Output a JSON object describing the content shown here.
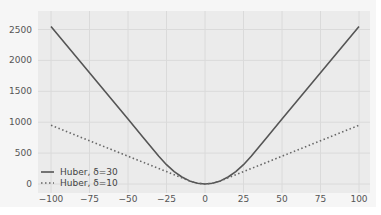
{
  "chart_data": {
    "type": "line",
    "title": "",
    "xlabel": "",
    "ylabel": "",
    "xlim": [
      -105,
      105
    ],
    "ylim": [
      -130,
      2680
    ],
    "grid": true,
    "legend_position": "lower left",
    "xticks": [
      -100,
      -75,
      -50,
      -25,
      0,
      25,
      50,
      75,
      100
    ],
    "yticks": [
      0,
      500,
      1000,
      1500,
      2000,
      2500
    ],
    "x": [
      -100,
      -90,
      -80,
      -70,
      -60,
      -50,
      -40,
      -30,
      -25,
      -20,
      -15,
      -10,
      -5,
      0,
      5,
      10,
      15,
      20,
      25,
      30,
      40,
      50,
      60,
      70,
      80,
      90,
      100
    ],
    "series": [
      {
        "name": "Huber, δ=30",
        "style": "solid",
        "color": "#555555",
        "values": [
          2550,
          2250,
          1950,
          1650,
          1350,
          1050,
          750,
          450,
          312.5,
          200,
          112.5,
          50,
          12.5,
          0,
          12.5,
          50,
          112.5,
          200,
          312.5,
          450,
          750,
          1050,
          1350,
          1650,
          1950,
          2250,
          2550
        ]
      },
      {
        "name": "Huber, δ=10",
        "style": "dotted",
        "color": "#666666",
        "values": [
          950,
          850,
          750,
          650,
          550,
          450,
          350,
          250,
          200,
          150,
          100,
          50,
          12.5,
          0,
          12.5,
          50,
          100,
          150,
          200,
          250,
          350,
          450,
          550,
          650,
          750,
          850,
          950
        ]
      }
    ],
    "data_provenance": {
      "method": "computed_from_formula",
      "formula": "Huber loss: 0.5*x^2 if |x| <= delta, else delta*(|x| - delta/2)",
      "verified_against_pixels": [
        {
          "point": "delta=30 at x=+/-100",
          "computed": 2550,
          "read_from_image": "approx 2550 (just above the 2500 gridline)"
        },
        {
          "point": "delta=10 at x=+/-100",
          "computed": 950,
          "read_from_image": "approx 950 (just below the 1000 gridline)"
        },
        {
          "point": "both series at x=0",
          "computed": 0,
          "read_from_image": "approx 0 (curve minimum at the 0 gridline)"
        }
      ],
      "note": "Only the endpoints and the minimum were measured from the pixels. Intermediate values are computed from the Huber formula, which the figure's legend and shape match; they are not independent readings of the plot."
    }
  },
  "axes": {
    "x_tick_labels": [
      "−100",
      "−75",
      "−50",
      "−25",
      "0",
      "25",
      "50",
      "75",
      "100"
    ],
    "y_tick_labels": [
      "0",
      "500",
      "1000",
      "1500",
      "2000",
      "2500"
    ]
  },
  "legend": {
    "items": [
      {
        "label": "Huber, δ=30",
        "style": "solid"
      },
      {
        "label": "Huber, δ=10",
        "style": "dotted"
      }
    ]
  },
  "colors": {
    "plot_background": "#ebebeb",
    "grid": "#dadada",
    "series_solid": "#555555",
    "series_dotted": "#666666",
    "tick_text": "#555555"
  }
}
